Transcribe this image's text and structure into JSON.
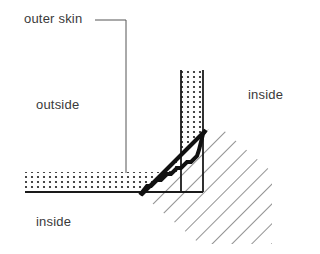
{
  "labels": {
    "outer_skin": "outer skin",
    "outside": "outside",
    "inside_right": "inside",
    "inside_bottom": "inside"
  },
  "colors": {
    "line": "#1a1a1a",
    "text": "#3a3a3a",
    "hatch": "#4a4a4a",
    "background": "#ffffff"
  }
}
